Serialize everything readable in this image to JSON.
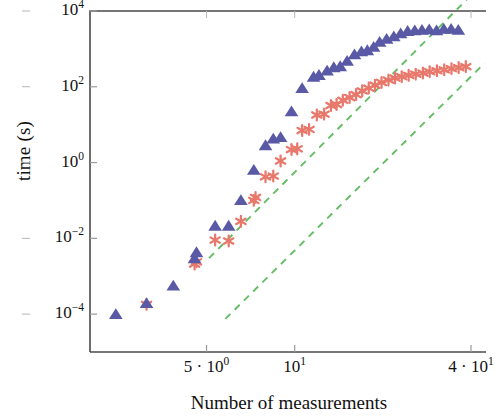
{
  "chart_data": {
    "type": "scatter",
    "title": "",
    "xlabel": "Number of measurements",
    "ylabel": "time (s)",
    "xscale": "log",
    "yscale": "log",
    "xlim": [
      2.0,
      45.0
    ],
    "ylim": [
      1e-05,
      10000.0
    ],
    "grid": false,
    "legend_position": "none",
    "x_tick_labels": [
      "5 · 10",
      "10",
      "4 · 10"
    ],
    "x_tick_exponents": [
      "0",
      "1",
      "1"
    ],
    "x_tick_values": [
      5,
      10,
      40
    ],
    "y_tick_labels": [
      "10",
      "10",
      "10",
      "10",
      "10"
    ],
    "y_tick_exponents": [
      "4",
      "2",
      "0",
      "−2",
      "−4"
    ],
    "y_tick_values": [
      10000,
      100,
      1,
      0.01,
      0.0001
    ],
    "series": [
      {
        "name": "triangles",
        "marker": "triangle",
        "color": "#5A59A6",
        "points": [
          [
            2.45,
            9.8e-05
          ],
          [
            3.12,
            0.00019
          ],
          [
            3.85,
            0.00055
          ],
          [
            4.55,
            0.0029
          ],
          [
            4.62,
            0.0042
          ],
          [
            5.35,
            0.021
          ],
          [
            5.95,
            0.021
          ],
          [
            6.55,
            0.1
          ],
          [
            7.25,
            0.63
          ],
          [
            7.95,
            2.8
          ],
          [
            8.45,
            4.2
          ],
          [
            8.95,
            4.6
          ],
          [
            9.75,
            22.0
          ],
          [
            10.6,
            90.0
          ],
          [
            11.6,
            180.0
          ],
          [
            12.1,
            200.0
          ],
          [
            12.9,
            260.0
          ],
          [
            13.6,
            320.0
          ],
          [
            14.3,
            340.0
          ],
          [
            15.1,
            470.0
          ],
          [
            16.0,
            700.0
          ],
          [
            16.9,
            840.0
          ],
          [
            17.7,
            900.0
          ],
          [
            18.6,
            1100.0
          ],
          [
            19.5,
            1500.0
          ],
          [
            20.6,
            1800.0
          ],
          [
            21.8,
            2100.0
          ],
          [
            23.0,
            2500.0
          ],
          [
            24.3,
            2900.0
          ],
          [
            25.7,
            3000.0
          ],
          [
            27.2,
            3100.0
          ],
          [
            28.8,
            3200.0
          ],
          [
            30.5,
            3000.0
          ],
          [
            32.3,
            3300.0
          ],
          [
            34.2,
            3300.0
          ],
          [
            36.2,
            3100.0
          ]
        ]
      },
      {
        "name": "asterisks",
        "marker": "asterisk",
        "color": "#E8786B",
        "points": [
          [
            3.12,
            0.00018
          ],
          [
            4.55,
            0.0021
          ],
          [
            4.62,
            0.0024
          ],
          [
            5.35,
            0.009
          ],
          [
            5.95,
            0.0085
          ],
          [
            6.55,
            0.028
          ],
          [
            7.25,
            0.1
          ],
          [
            7.35,
            0.12
          ],
          [
            7.95,
            0.42
          ],
          [
            8.45,
            0.44
          ],
          [
            8.95,
            1.1
          ],
          [
            9.75,
            2.2
          ],
          [
            10.2,
            2.3
          ],
          [
            10.6,
            7.0
          ],
          [
            11.2,
            7.5
          ],
          [
            11.9,
            18.0
          ],
          [
            12.6,
            19.0
          ],
          [
            13.3,
            32.0
          ],
          [
            13.9,
            34.0
          ],
          [
            14.6,
            44.0
          ],
          [
            15.4,
            52.0
          ],
          [
            16.2,
            62.0
          ],
          [
            17.0,
            78.0
          ],
          [
            17.9,
            92.0
          ],
          [
            18.8,
            110.0
          ],
          [
            19.8,
            130.0
          ],
          [
            20.9,
            150.0
          ],
          [
            22.0,
            170.0
          ],
          [
            23.2,
            185.0
          ],
          [
            24.5,
            200.0
          ],
          [
            25.9,
            215.0
          ],
          [
            27.4,
            230.0
          ],
          [
            28.9,
            250.0
          ],
          [
            30.6,
            265.0
          ],
          [
            32.4,
            280.0
          ],
          [
            34.3,
            300.0
          ],
          [
            36.3,
            320.0
          ],
          [
            38.4,
            340.0
          ]
        ]
      }
    ],
    "reference_lines": [
      {
        "name": "upper-guide",
        "style": "dashed",
        "color": "#63BE63",
        "x0": 5.1,
        "y0": 0.003,
        "x1": 40.0,
        "y1": 26000.0
      },
      {
        "name": "lower-guide",
        "style": "dashed",
        "color": "#63BE63",
        "x0": 5.8,
        "y0": 7.5e-05,
        "x1": 44.5,
        "y1": 420.0
      }
    ]
  },
  "axes": {
    "y_title": "time (s)",
    "x_title": "Number of measurements"
  }
}
